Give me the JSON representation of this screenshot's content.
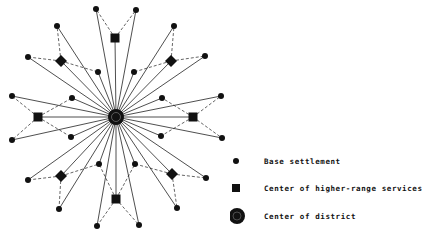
{
  "diagram": {
    "colors": {
      "ink": "#111111",
      "background": "#ffffff"
    },
    "center": {
      "x": 116,
      "y": 117,
      "type": "center-of-district"
    },
    "base_settlements": [
      {
        "x": 96,
        "y": 9
      },
      {
        "x": 136,
        "y": 10
      },
      {
        "x": 57,
        "y": 26
      },
      {
        "x": 28,
        "y": 57
      },
      {
        "x": 98,
        "y": 72
      },
      {
        "x": 174,
        "y": 26
      },
      {
        "x": 205,
        "y": 56
      },
      {
        "x": 134,
        "y": 72
      },
      {
        "x": 12,
        "y": 96
      },
      {
        "x": 72,
        "y": 98
      },
      {
        "x": 221,
        "y": 96
      },
      {
        "x": 162,
        "y": 98
      },
      {
        "x": 12,
        "y": 140
      },
      {
        "x": 71,
        "y": 137
      },
      {
        "x": 222,
        "y": 138
      },
      {
        "x": 161,
        "y": 136
      },
      {
        "x": 99,
        "y": 164
      },
      {
        "x": 28,
        "y": 180
      },
      {
        "x": 59,
        "y": 209
      },
      {
        "x": 135,
        "y": 164
      },
      {
        "x": 206,
        "y": 178
      },
      {
        "x": 177,
        "y": 208
      },
      {
        "x": 97,
        "y": 226
      },
      {
        "x": 139,
        "y": 225
      }
    ],
    "higher_range_centers": [
      {
        "x": 115,
        "y": 38,
        "shape": "square",
        "links": [
          0,
          1
        ]
      },
      {
        "x": 61,
        "y": 61,
        "shape": "diamond",
        "links": [
          2,
          3,
          4
        ]
      },
      {
        "x": 171,
        "y": 61,
        "shape": "diamond",
        "links": [
          5,
          6,
          7
        ]
      },
      {
        "x": 38,
        "y": 117,
        "shape": "square",
        "links": [
          8,
          9,
          12,
          13
        ]
      },
      {
        "x": 193,
        "y": 117,
        "shape": "square",
        "links": [
          10,
          11,
          14,
          15
        ]
      },
      {
        "x": 61,
        "y": 176,
        "shape": "diamond",
        "links": [
          16,
          17,
          18
        ]
      },
      {
        "x": 172,
        "y": 174,
        "shape": "diamond",
        "links": [
          19,
          20,
          21
        ]
      },
      {
        "x": 116,
        "y": 199,
        "shape": "square",
        "links": [
          22,
          23,
          16,
          19
        ]
      }
    ]
  },
  "legend": {
    "items": [
      {
        "symbol": "circle-small",
        "label": "Base settlement"
      },
      {
        "symbol": "square",
        "label": "Center of higher-range services"
      },
      {
        "symbol": "circle-large",
        "label": "Center of district"
      }
    ]
  }
}
